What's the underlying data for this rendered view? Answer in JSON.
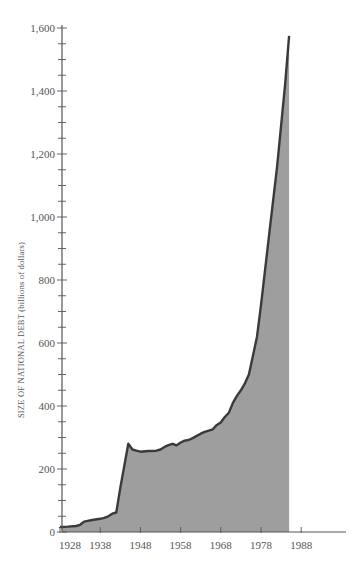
{
  "chart_data": {
    "type": "area",
    "title": "",
    "xlabel": "",
    "ylabel": "SIZE OF NATIONAL DEBT (billions of dollars)",
    "ylim": [
      0,
      1600
    ],
    "xlim": [
      1926,
      2000
    ],
    "grid": false,
    "legend": null,
    "x_ticks": [
      "1928",
      "1938",
      "1948",
      "1958",
      "1968",
      "1978",
      "1988"
    ],
    "y_ticks": [
      "0",
      "200",
      "400",
      "600",
      "800",
      "1,000",
      "1,200",
      "1,400",
      "1,600"
    ],
    "y_minor_tick_step": 50,
    "colors": {
      "fill": "#9e9e9e",
      "line": "#3a3a3a",
      "axis": "#555555"
    },
    "series": [
      {
        "name": "National debt",
        "x": [
          1928,
          1930,
          1932,
          1933,
          1934,
          1936,
          1938,
          1939,
          1940,
          1941,
          1942,
          1943,
          1944,
          1945,
          1946,
          1947,
          1948,
          1950,
          1952,
          1953,
          1954,
          1955,
          1956,
          1957,
          1958,
          1959,
          1960,
          1961,
          1962,
          1963,
          1964,
          1965,
          1966,
          1967,
          1968,
          1969,
          1970,
          1971,
          1972,
          1973,
          1974,
          1975,
          1976,
          1977,
          1978,
          1980,
          1982,
          1984,
          1985
        ],
        "values": [
          16,
          17,
          19,
          23,
          33,
          38,
          42,
          45,
          50,
          58,
          62,
          140,
          210,
          280,
          262,
          258,
          255,
          257,
          258,
          262,
          270,
          276,
          280,
          275,
          284,
          290,
          292,
          298,
          305,
          312,
          318,
          322,
          326,
          340,
          348,
          365,
          378,
          410,
          432,
          450,
          472,
          500,
          560,
          620,
          720,
          940,
          1160,
          1420,
          1575
        ]
      }
    ]
  }
}
